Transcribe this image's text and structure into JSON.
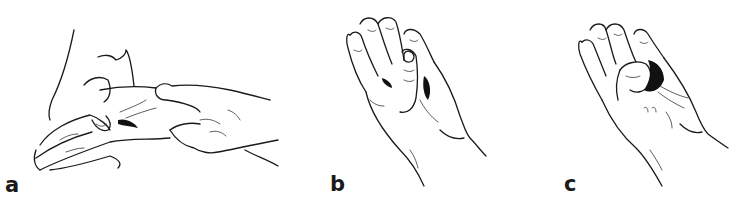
{
  "figure": {
    "panels": [
      {
        "id": "a",
        "label": "a",
        "description": "Examiner's hands grasping the patient's hand and wrist"
      },
      {
        "id": "b",
        "label": "b",
        "description": "Hand with thumb flexed across the palm, fingers extended"
      },
      {
        "id": "c",
        "label": "c",
        "description": "Hand with thumb tucked into palm toward little finger base"
      }
    ],
    "colors": {
      "ink": "#1a1a1a",
      "background": "#ffffff"
    }
  }
}
